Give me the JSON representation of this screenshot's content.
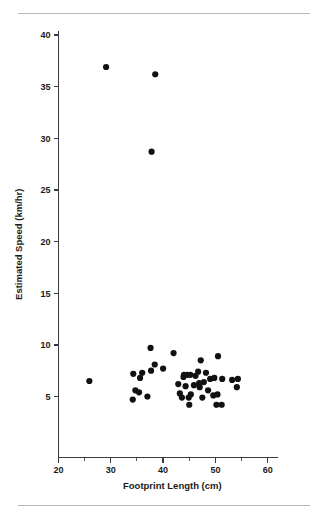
{
  "chart_data": {
    "type": "scatter",
    "title": "",
    "xlabel": "Footprint Length (cm)",
    "ylabel": "Estimated Speed (km/hr)",
    "xlim": [
      20,
      62
    ],
    "ylim": [
      0,
      41.5
    ],
    "x_ticks": [
      20,
      30,
      40,
      50,
      60
    ],
    "x_tick_labels": [
      "20",
      "30",
      "40",
      "50",
      "60"
    ],
    "x_minor_ticks": [
      25,
      35,
      45,
      55
    ],
    "y_ticks": [
      5,
      10,
      15,
      20,
      25,
      30,
      35,
      40
    ],
    "y_tick_labels": [
      "5",
      "10",
      "15",
      "20",
      "25",
      "30",
      "35",
      "40"
    ],
    "grid": false,
    "legend": "none",
    "marker": "filled-circle",
    "marker_color": "#111113",
    "marker_size_px": 3.1,
    "points": [
      {
        "x": 29.1,
        "y": 36.9
      },
      {
        "x": 38.5,
        "y": 36.2
      },
      {
        "x": 37.8,
        "y": 28.7
      },
      {
        "x": 25.9,
        "y": 6.5
      },
      {
        "x": 37.6,
        "y": 9.7
      },
      {
        "x": 42.0,
        "y": 9.2
      },
      {
        "x": 50.5,
        "y": 8.9
      },
      {
        "x": 47.2,
        "y": 8.5
      },
      {
        "x": 38.4,
        "y": 8.1
      },
      {
        "x": 40.0,
        "y": 7.7
      },
      {
        "x": 37.7,
        "y": 7.5
      },
      {
        "x": 34.3,
        "y": 7.2
      },
      {
        "x": 36.0,
        "y": 7.3
      },
      {
        "x": 46.7,
        "y": 7.4
      },
      {
        "x": 48.2,
        "y": 7.3
      },
      {
        "x": 44.0,
        "y": 7.1
      },
      {
        "x": 44.6,
        "y": 7.1
      },
      {
        "x": 45.2,
        "y": 7.1
      },
      {
        "x": 46.2,
        "y": 7.0
      },
      {
        "x": 43.9,
        "y": 6.9
      },
      {
        "x": 35.6,
        "y": 6.8
      },
      {
        "x": 49.0,
        "y": 6.7
      },
      {
        "x": 49.8,
        "y": 6.8
      },
      {
        "x": 51.3,
        "y": 6.7
      },
      {
        "x": 54.3,
        "y": 6.7
      },
      {
        "x": 53.2,
        "y": 6.6
      },
      {
        "x": 47.8,
        "y": 6.4
      },
      {
        "x": 46.9,
        "y": 6.3
      },
      {
        "x": 42.9,
        "y": 6.2
      },
      {
        "x": 45.9,
        "y": 6.1
      },
      {
        "x": 44.3,
        "y": 6.0
      },
      {
        "x": 47.0,
        "y": 5.9
      },
      {
        "x": 54.1,
        "y": 5.9
      },
      {
        "x": 48.6,
        "y": 5.6
      },
      {
        "x": 34.7,
        "y": 5.6
      },
      {
        "x": 35.4,
        "y": 5.4
      },
      {
        "x": 43.2,
        "y": 5.3
      },
      {
        "x": 45.3,
        "y": 5.2
      },
      {
        "x": 49.6,
        "y": 5.1
      },
      {
        "x": 50.4,
        "y": 5.2
      },
      {
        "x": 37.0,
        "y": 5.0
      },
      {
        "x": 43.6,
        "y": 4.9
      },
      {
        "x": 44.9,
        "y": 4.9
      },
      {
        "x": 47.5,
        "y": 4.9
      },
      {
        "x": 34.2,
        "y": 4.7
      },
      {
        "x": 45.0,
        "y": 4.2
      },
      {
        "x": 50.2,
        "y": 4.2
      },
      {
        "x": 51.2,
        "y": 4.2
      }
    ]
  },
  "figure": {
    "rule_top_label": "top-divider",
    "rule_bottom_label": "bottom-divider"
  }
}
